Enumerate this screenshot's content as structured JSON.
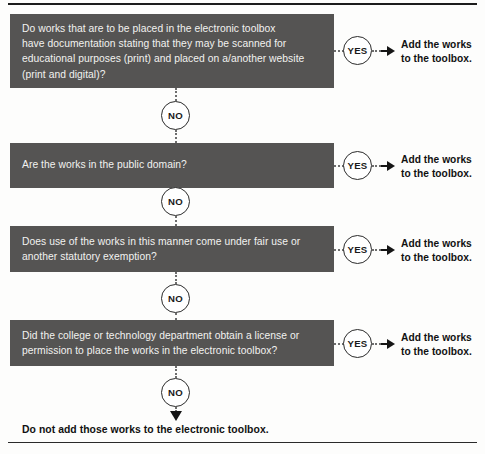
{
  "document": {
    "title": "Electronic toolbox copyright decision flowchart",
    "box_fill_color": "#555453",
    "box_text_color": "#f2f2f0",
    "connector_color": "#6d6d6d",
    "arrow_color": "#151515"
  },
  "rules": {
    "top_label": "top-divider",
    "bottom_label": "bottom-divider"
  },
  "steps": [
    {
      "id": "step-1",
      "question_lines": [
        "Do works that are to be placed in the electronic toolbox",
        "have documentation stating that they may be scanned for",
        "educational purposes (print) and placed on a/another website",
        "(print and digital)?"
      ],
      "yes_label": "YES",
      "no_label": "NO",
      "outcome_lines": [
        "Add the works",
        "to the toolbox."
      ]
    },
    {
      "id": "step-2",
      "question_lines": [
        "Are the works in the public domain?"
      ],
      "yes_label": "YES",
      "no_label": "NO",
      "outcome_lines": [
        "Add the works",
        "to the toolbox."
      ]
    },
    {
      "id": "step-3",
      "question_lines": [
        "Does use of the works in this manner come under fair use or",
        "another statutory exemption?"
      ],
      "yes_label": "YES",
      "no_label": "NO",
      "outcome_lines": [
        "Add the works",
        "to the toolbox."
      ]
    },
    {
      "id": "step-4",
      "question_lines": [
        "Did the college or technology department obtain a license or",
        "permission to place the works in the electronic toolbox?"
      ],
      "yes_label": "YES",
      "no_label": "NO",
      "outcome_lines": [
        "Add the works",
        "to the toolbox."
      ]
    }
  ],
  "final": {
    "no_label": "NO",
    "conclusion": "Do not add those works to the electronic toolbox."
  }
}
